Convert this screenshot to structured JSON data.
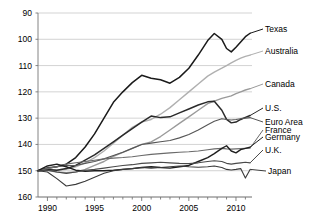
{
  "chart_data": {
    "type": "line",
    "title": "",
    "subtitle": "",
    "xlabel": "",
    "ylabel": "",
    "xlim": [
      1989.0,
      2011.7
    ],
    "ylim": [
      90,
      160
    ],
    "grid": true,
    "grid_axis": "y",
    "legend": "inline-right-end-labels",
    "index_base": 100,
    "y_ticks": [
      90,
      100,
      110,
      120,
      130,
      140,
      150,
      160
    ],
    "x_ticks": [
      1990,
      1995,
      2000,
      2005,
      2010
    ],
    "x_minor_tick_step": 1,
    "x": [
      1989.0,
      1990,
      1991,
      1992,
      1993,
      1994,
      1995,
      1996,
      1997,
      1998,
      1999,
      2000,
      2001,
      2002,
      2003,
      2004,
      2005,
      2006,
      2007,
      2007.7,
      2008.5,
      2009,
      2009.5,
      2010,
      2010.5,
      2011,
      2011.5
    ],
    "series": [
      {
        "name": "Texas",
        "color": "#1a1a1a",
        "width": 1.5,
        "label_x": 265,
        "label_y": 29,
        "values": [
          100,
          101,
          101.5,
          102.5,
          105,
          109,
          114,
          120,
          126,
          130,
          133.5,
          136.3,
          135.2,
          134.6,
          133.3,
          135.5,
          139,
          144,
          149.5,
          152.2,
          150,
          146.5,
          145.2,
          147,
          149,
          151,
          152.3
        ]
      },
      {
        "name": "Australia",
        "color": "#b0b0b0",
        "width": 1.4,
        "label_x": 265,
        "label_y": 51,
        "values": [
          100,
          100.5,
          100.2,
          100.5,
          101.5,
          103,
          105,
          107.5,
          110.5,
          113.5,
          116.5,
          118.5,
          119.5,
          121.5,
          124,
          127,
          130,
          133,
          136,
          137.5,
          139,
          140,
          141,
          142,
          142.8,
          143.5,
          144
        ]
      },
      {
        "name": "Canada",
        "color": "#9a9a9a",
        "width": 1.4,
        "label_x": 265,
        "label_y": 84,
        "values": [
          100,
          100.2,
          99.5,
          99.2,
          99.5,
          100.5,
          102,
          103.5,
          105.5,
          107,
          108.5,
          110,
          111,
          113,
          115.5,
          118,
          120.5,
          123,
          125.5,
          126.5,
          127.5,
          128,
          128.5,
          129.3,
          130,
          130.7,
          131.2
        ]
      },
      {
        "name": "U.S.",
        "color": "#2a2a2a",
        "width": 1.5,
        "label_x": 265,
        "label_y": 108,
        "values": [
          100,
          100.5,
          100.2,
          100.8,
          102,
          104,
          106,
          108.5,
          111,
          113.5,
          116,
          118.5,
          120.8,
          120.2,
          120.5,
          122,
          123.5,
          125,
          126.2,
          126.4,
          123,
          119.5,
          118.2,
          118.5,
          119.5,
          120.3,
          121
        ]
      },
      {
        "name": "Euro Area",
        "color": "#555555",
        "width": 1.1,
        "label_x": 265,
        "label_y": 122,
        "values": [
          100,
          101,
          101.5,
          102,
          102,
          102.8,
          103.5,
          104.5,
          105.8,
          107,
          108.5,
          110,
          110.5,
          111,
          111.5,
          112.5,
          113.8,
          115.5,
          117.5,
          118.8,
          119.8,
          119.5,
          119.3,
          119.5,
          119.8,
          120,
          120.2
        ]
      },
      {
        "name": "France",
        "color": "#6a6a6a",
        "width": 1.1,
        "label_x": 265,
        "label_y": 130,
        "values": [
          100,
          100.8,
          101.5,
          102.5,
          103,
          103.5,
          104,
          104.5,
          104.8,
          105,
          105.3,
          105.8,
          106.2,
          106.5,
          106.8,
          107,
          107.2,
          107.5,
          108,
          108.3,
          108.5,
          108.3,
          108.2,
          108.3,
          108.4,
          108.5,
          108.6
        ]
      },
      {
        "name": "Germany",
        "color": "#1f1f1f",
        "width": 1.4,
        "label_x": 265,
        "label_y": 137,
        "values": [
          100,
          101.8,
          102.5,
          101.5,
          100.2,
          99.8,
          100,
          100,
          100.2,
          100.5,
          100.8,
          101.2,
          101.5,
          101.2,
          101,
          101.5,
          102,
          103.5,
          105,
          106.5,
          108.5,
          109.5,
          107.5,
          106.8,
          108,
          108.5,
          109
        ]
      },
      {
        "name": "U.K.",
        "color": "#4a4a4a",
        "width": 1.1,
        "label_x": 265,
        "label_y": 150,
        "values": [
          100,
          100.2,
          99.5,
          99,
          99.5,
          100.2,
          100.5,
          101,
          101.5,
          102,
          102.3,
          102.8,
          103,
          103.2,
          103,
          102.8,
          102.7,
          103,
          103.5,
          103.8,
          103.5,
          102.8,
          102.5,
          102.8,
          103,
          103.2,
          103
        ]
      },
      {
        "name": "Japan",
        "color": "#3a3a3a",
        "width": 1.1,
        "label_x": 268,
        "label_y": 171,
        "values": [
          100,
          99.5,
          97,
          94.2,
          94.8,
          96,
          97.5,
          99,
          100,
          100.5,
          100.8,
          101.2,
          101,
          101.2,
          101.5,
          101.8,
          101.5,
          101.3,
          101.5,
          101.8,
          101.2,
          100.5,
          100.3,
          100.5,
          100.8,
          97.2,
          100.5
        ]
      }
    ]
  },
  "axes": {
    "y_tick_labels": [
      "160",
      "150",
      "140",
      "130",
      "120",
      "110",
      "100",
      "90"
    ],
    "x_tick_labels": [
      "1990",
      "1995",
      "2000",
      "2005",
      "2010"
    ]
  },
  "style": {
    "grid_color": "#c8c8c8",
    "axis_color": "#777777",
    "background": "#ffffff",
    "text_color": "#000000"
  }
}
